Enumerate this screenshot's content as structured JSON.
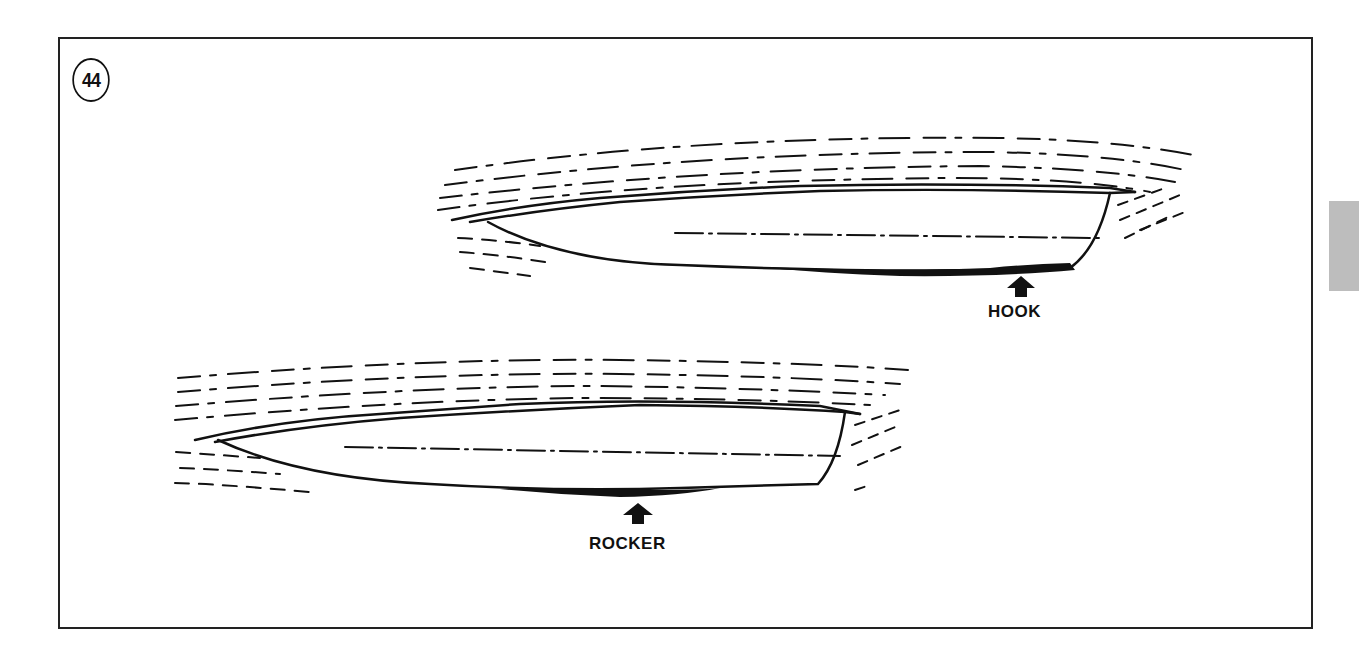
{
  "figure": {
    "number": "44",
    "labels": {
      "hook": "HOOK",
      "rocker": "ROCKER"
    },
    "colors": {
      "ink": "#111111",
      "background": "#ffffff",
      "side_tab": "#bdbdbd"
    },
    "hulls": [
      {
        "name": "upper-hull",
        "defect": "hook",
        "description": "Hull with hook near transom"
      },
      {
        "name": "lower-hull",
        "defect": "rocker",
        "description": "Hull with rocker amidships"
      }
    ]
  }
}
